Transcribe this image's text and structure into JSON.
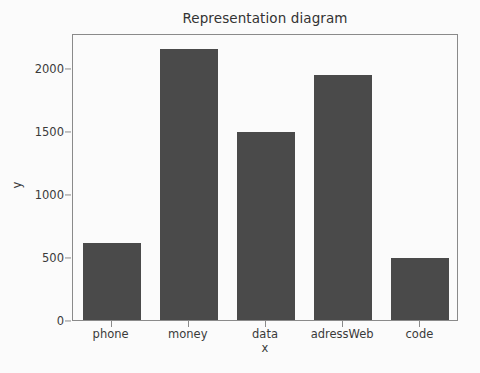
{
  "chart_data": {
    "type": "bar",
    "title": "Representation diagram",
    "xlabel": "x",
    "ylabel": "y",
    "categories": [
      "phone",
      "money",
      "data",
      "adressWeb",
      "code"
    ],
    "values": [
      610,
      2150,
      1490,
      1950,
      495
    ],
    "yticks": [
      0,
      500,
      1000,
      1500,
      2000
    ],
    "ytick_labels": [
      "0",
      "500",
      "1000",
      "1500",
      "2000"
    ],
    "ylim": [
      0,
      2280
    ],
    "grid": false,
    "legend": null,
    "bar_color": "#4a4a4a",
    "background_color": "#fbfbfb",
    "axis_color": "#8a8a8a"
  }
}
